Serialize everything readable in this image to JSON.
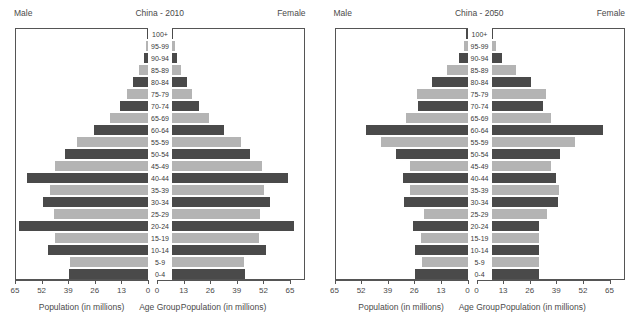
{
  "chart_data": [
    {
      "type": "bar",
      "subtype": "population-pyramid",
      "title": "China - 2010",
      "left_label": "Male",
      "right_label": "Female",
      "xlabel_left": "Population (in millions)",
      "xlabel_center": "Age Group",
      "xlabel_right": "Population (in millions)",
      "ylabel": "Age Group",
      "xlim": [
        0,
        65
      ],
      "xticks": [
        65,
        52,
        39,
        26,
        13,
        0
      ],
      "xticks_right": [
        0,
        13,
        26,
        39,
        52,
        65
      ],
      "grid": false,
      "legend": "none",
      "categories": [
        "100+",
        "95-99",
        "90-94",
        "85-89",
        "80-84",
        "75-79",
        "70-74",
        "65-69",
        "60-64",
        "55-59",
        "50-54",
        "45-49",
        "40-44",
        "35-39",
        "30-34",
        "25-29",
        "20-24",
        "15-19",
        "10-14",
        "5-9",
        "0-4"
      ],
      "series": [
        {
          "name": "Male",
          "side": "left",
          "values": [
            0.3,
            0.9,
            2.1,
            4.2,
            7.1,
            10.2,
            13.6,
            18.4,
            26.5,
            34.6,
            40.7,
            45.6,
            59.0,
            47.8,
            51.5,
            45.8,
            63.0,
            45.6,
            49.0,
            38.0,
            38.5
          ]
        },
        {
          "name": "Female",
          "side": "right",
          "values": [
            0.6,
            1.3,
            2.6,
            4.5,
            7.4,
            10.0,
            13.3,
            17.9,
            25.6,
            33.6,
            38.3,
            43.9,
            56.6,
            44.9,
            48.1,
            42.9,
            59.7,
            42.6,
            45.8,
            35.1,
            35.5
          ]
        }
      ]
    },
    {
      "type": "bar",
      "subtype": "population-pyramid",
      "title": "China - 2050",
      "left_label": "Male",
      "right_label": "Female",
      "xlabel_left": "Population (in millions)",
      "xlabel_center": "Age Group",
      "xlabel_right": "Population (in millions)",
      "ylabel": "Age Group",
      "xlim": [
        0,
        65
      ],
      "xticks": [
        65,
        52,
        39,
        26,
        13,
        0
      ],
      "xticks_right": [
        0,
        13,
        26,
        39,
        52,
        65
      ],
      "grid": false,
      "legend": "none",
      "categories": [
        "100+",
        "95-99",
        "90-94",
        "85-89",
        "80-84",
        "75-79",
        "70-74",
        "65-69",
        "60-64",
        "55-59",
        "50-54",
        "45-49",
        "40-44",
        "35-39",
        "30-34",
        "25-29",
        "20-24",
        "15-19",
        "10-14",
        "5-9",
        "0-4"
      ],
      "series": [
        {
          "name": "Male",
          "side": "left",
          "values": [
            0.6,
            1.6,
            4.3,
            10.0,
            17.2,
            24.5,
            24.4,
            30.0,
            49.6,
            42.1,
            35.0,
            27.9,
            31.5,
            28.0,
            31.0,
            21.5,
            26.8,
            22.6,
            25.8,
            22.2,
            25.7
          ]
        },
        {
          "name": "Female",
          "side": "right",
          "values": [
            0.4,
            2.0,
            5.1,
            11.8,
            19.4,
            26.7,
            25.4,
            29.1,
            54.5,
            40.9,
            33.6,
            29.0,
            31.7,
            33.1,
            32.5,
            27.3,
            23.0,
            23.0,
            23.3,
            23.2,
            23.3
          ]
        }
      ]
    }
  ]
}
